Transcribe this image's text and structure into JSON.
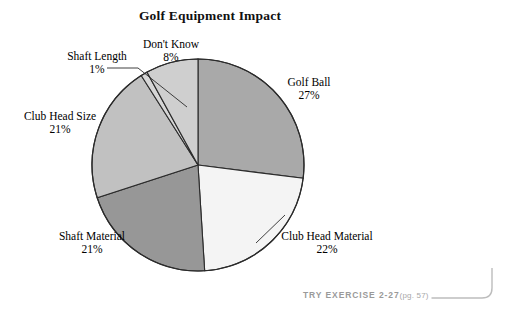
{
  "chart_data": {
    "type": "pie",
    "title": "Golf Equipment Impact",
    "xlabel": "",
    "ylabel": "",
    "legend_position": "none",
    "grid": false,
    "categories": [
      "Golf Ball",
      "Club Head Material",
      "Shaft Material",
      "Club Head Size",
      "Shaft Length",
      "Don't Know"
    ],
    "values": [
      27,
      22,
      21,
      21,
      1,
      8
    ],
    "value_unit": "%",
    "start_angle_deg": 0,
    "direction": "clockwise",
    "slices": [
      {
        "label": "Golf Ball",
        "value": 27,
        "pct_text": "27%",
        "color": "#a9a9a9"
      },
      {
        "label": "Club Head Material",
        "value": 22,
        "pct_text": "22%",
        "color": "#f4f4f4"
      },
      {
        "label": "Shaft Material",
        "value": 21,
        "pct_text": "21%",
        "color": "#979797"
      },
      {
        "label": "Club Head Size",
        "value": 21,
        "pct_text": "21%",
        "color": "#c1c1c1"
      },
      {
        "label": "Shaft Length",
        "value": 1,
        "pct_text": "1%",
        "color": "#d6d6d6"
      },
      {
        "label": "Don't Know",
        "value": 8,
        "pct_text": "8%",
        "color": "#cfcfcf"
      }
    ]
  },
  "chart": {
    "title": "Golf Equipment Impact",
    "geometry": {
      "cx": 198,
      "cy": 165,
      "r": 106
    },
    "outline_color": "#2b2b2b"
  },
  "labels": {
    "golf_ball": {
      "name": "Golf Ball",
      "pct": "27%"
    },
    "club_head_material": {
      "name": "Club Head Material",
      "pct": "22%"
    },
    "shaft_material": {
      "name": "Shaft Material",
      "pct": "21%"
    },
    "club_head_size": {
      "name": "Club Head Size",
      "pct": "21%"
    },
    "shaft_length": {
      "name": "Shaft Length",
      "pct": "1%"
    },
    "dont_know": {
      "name": "Don't Know",
      "pct": "8%"
    }
  },
  "footer": {
    "exercise_label": "TRY EXERCISE 2-27",
    "page_ref": "(pg. 57)",
    "color": "#9a9a9a"
  }
}
